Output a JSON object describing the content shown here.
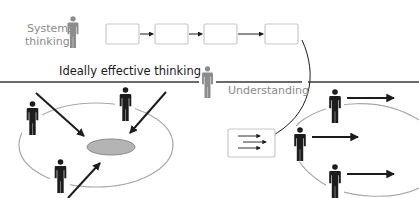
{
  "diagram": {
    "labels": {
      "systems_thinking_line1": "Systems",
      "systems_thinking_line2": "thinking",
      "ideally_effective": "Ideally effective thinking",
      "understanding": "Understanding"
    },
    "colors": {
      "figure_dark": "#1c1c1c",
      "figure_gray": "#8c8c8c",
      "box_border": "#c8c8c8",
      "ellipse_stroke": "#a8a8a8",
      "center_oval_fill": "#b4b4b4",
      "divider": "#3a3a3a"
    },
    "process_chain": {
      "box_count": 4,
      "arrow_count": 3
    },
    "left_cluster": {
      "people_count": 3,
      "inward_arrows": 3
    },
    "right_cluster": {
      "people_count": 3,
      "outward_arrows": 3,
      "box_arrows": 3
    }
  }
}
